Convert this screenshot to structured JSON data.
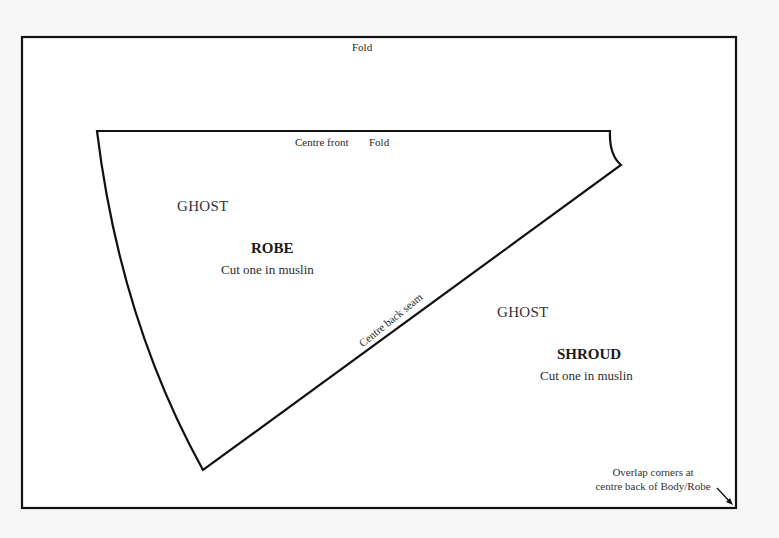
{
  "pattern": {
    "outer_fold_label": "Fold",
    "robe_piece": {
      "top_labels": {
        "centre_front": "Centre front",
        "fold": "Fold"
      },
      "ghost_label": "GHOST",
      "title": "ROBE",
      "instruction": "Cut one in muslin",
      "seam_label": "Centre back seam"
    },
    "shroud_piece": {
      "ghost_label": "GHOST",
      "title": "SHROUD",
      "instruction": "Cut one in muslin"
    },
    "overlap_note": {
      "line1": "Overlap corners at",
      "line2": "centre back of Body/Robe"
    }
  },
  "colors": {
    "background": "#f7f7f7",
    "sheet": "#ffffff",
    "line": "#111111",
    "text": "#2a2a2a"
  }
}
